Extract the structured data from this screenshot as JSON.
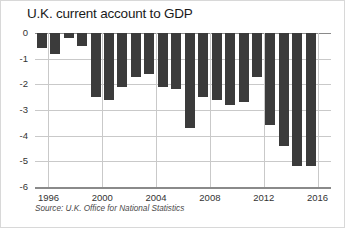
{
  "chart_data": {
    "type": "bar",
    "title": "U.K. current account to GDP",
    "subtitle": "",
    "xlabel": "",
    "ylabel": "",
    "source": "Source: U.K. Office for National Statistics",
    "ylim": [
      -6,
      0
    ],
    "y_ticks": [
      0,
      -1,
      -2,
      -3,
      -4,
      -5,
      -6
    ],
    "y_tick_labels": [
      "0",
      "-1",
      "-2",
      "-3",
      "-4",
      "-5",
      "-6"
    ],
    "x_tick_years": [
      1996,
      2000,
      2004,
      2008,
      2012,
      2016
    ],
    "x_tick_labels": [
      "1996",
      "2000",
      "2004",
      "2008",
      "2012",
      "2016"
    ],
    "grid": true,
    "legend": "none",
    "bar_color": "#3b3b3b",
    "grid_color": "#c9c9c9",
    "axis_color": "#8a8a8a",
    "categories": [
      "1995",
      "1996",
      "1997",
      "1998",
      "1999",
      "2000",
      "2001",
      "2002",
      "2003",
      "2004",
      "2005",
      "2006",
      "2007",
      "2008",
      "2009",
      "2010",
      "2011",
      "2012",
      "2013",
      "2014",
      "2015"
    ],
    "values": [
      -0.6,
      -0.8,
      -0.2,
      -0.5,
      -2.5,
      -2.6,
      -2.1,
      -1.7,
      -1.6,
      -2.1,
      -2.2,
      -3.7,
      -2.5,
      -2.6,
      -2.8,
      -2.7,
      -1.7,
      -3.6,
      -4.4,
      -5.2,
      -5.2
    ],
    "series": [
      {
        "name": "U.K. current account to GDP",
        "unit": "% of GDP",
        "values": [
          -0.6,
          -0.8,
          -0.2,
          -0.5,
          -2.5,
          -2.6,
          -2.1,
          -1.7,
          -1.6,
          -2.1,
          -2.2,
          -3.7,
          -2.5,
          -2.6,
          -2.8,
          -2.7,
          -1.7,
          -3.6,
          -4.4,
          -5.2,
          -5.2
        ]
      }
    ]
  }
}
